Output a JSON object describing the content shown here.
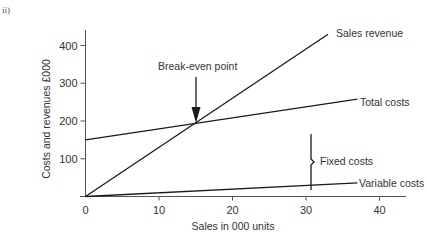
{
  "figure": {
    "part_label": "ii)"
  },
  "chart_data": {
    "type": "line",
    "title": "",
    "xlabel": "Sales in 000 units",
    "ylabel": "Costs and revenues £000",
    "xlim": [
      0,
      44
    ],
    "ylim": [
      0,
      430
    ],
    "xticks": [
      0,
      10,
      20,
      30,
      40
    ],
    "yticks": [
      100,
      200,
      300,
      400
    ],
    "xtick_labels": [
      "0",
      "10",
      "20",
      "30",
      "40"
    ],
    "ytick_labels": [
      "100",
      "200",
      "300",
      "400"
    ],
    "grid": false,
    "legend": "none (inline labels at line ends)",
    "series": [
      {
        "name": "Sales revenue",
        "x": [
          0,
          33
        ],
        "y": [
          0,
          430
        ]
      },
      {
        "name": "Total costs",
        "x": [
          0,
          37
        ],
        "y": [
          150,
          258
        ]
      },
      {
        "name": "Variable costs",
        "x": [
          0,
          37
        ],
        "y": [
          0,
          36
        ]
      }
    ],
    "annotations": [
      {
        "text": "Break-even point",
        "type": "arrow",
        "x": 15,
        "y": 195
      },
      {
        "text": "Fixed costs",
        "type": "brace",
        "x": 30.5,
        "y_from": 89,
        "y_to": 239
      }
    ]
  },
  "labels": {
    "sales_revenue": "Sales revenue",
    "total_costs": "Total costs",
    "variable_costs": "Variable costs",
    "fixed_costs": "Fixed costs",
    "break_even": "Break-even point",
    "xaxis": "Sales in 000 units",
    "yaxis": "Costs and revenues £000"
  },
  "colors": {
    "line": "#1a1a1a",
    "axis": "#555555",
    "text": "#333333"
  }
}
